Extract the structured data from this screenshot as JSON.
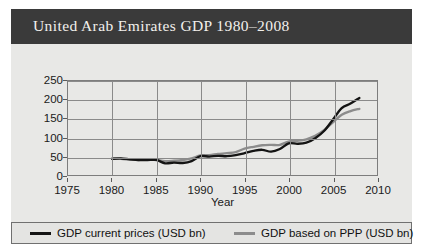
{
  "title": "United Arab Emirates GDP 1980–2008",
  "colors": {
    "title_bar_bg": "#3a3a3a",
    "title_text": "#f2f0ec",
    "panel_bg": "#e8e8e6",
    "grid": "#8a8a8a",
    "frame": "#7d7d7d",
    "series_current_prices": "#141414",
    "series_ppp": "#8c8c8c",
    "legend_bg": "#e4e4e2",
    "legend_border": "#707070"
  },
  "legend": {
    "position": "below-plot",
    "entries": [
      {
        "label": "GDP current prices (USD bn)",
        "color": "#141414",
        "icon": "line-swatch"
      },
      {
        "label": "GDP based on PPP (USD bn)",
        "color": "#8c8c8c",
        "icon": "line-swatch"
      }
    ]
  },
  "chart_data": {
    "type": "line",
    "title": "United Arab Emirates GDP 1980–2008",
    "xlabel": "Year",
    "ylabel": "",
    "xlim": [
      1975,
      2010
    ],
    "ylim": [
      0,
      250
    ],
    "xticks": [
      1975,
      1980,
      1985,
      1990,
      1995,
      2000,
      2005,
      2010
    ],
    "yticks": [
      0,
      50,
      100,
      150,
      200,
      250
    ],
    "grid": true,
    "x": [
      1980,
      1981,
      1982,
      1983,
      1984,
      1985,
      1986,
      1987,
      1988,
      1989,
      1990,
      1991,
      1992,
      1993,
      1994,
      1995,
      1996,
      1997,
      1998,
      1999,
      2000,
      2001,
      2002,
      2003,
      2004,
      2005,
      2006,
      2007,
      2008
    ],
    "series": [
      {
        "name": "GDP current prices (USD bn)",
        "color": "#141414",
        "values": [
          43,
          44,
          42,
          40,
          40,
          40,
          31,
          33,
          32,
          37,
          50,
          49,
          51,
          50,
          53,
          58,
          64,
          67,
          62,
          69,
          84,
          83,
          86,
          98,
          117,
          147,
          178,
          190,
          205
        ]
      },
      {
        "name": "GDP based on PPP (USD bn)",
        "color": "#8c8c8c",
        "values": [
          44,
          43,
          41,
          40,
          42,
          40,
          37,
          38,
          40,
          44,
          52,
          53,
          56,
          58,
          61,
          70,
          75,
          79,
          80,
          80,
          89,
          91,
          95,
          104,
          119,
          140,
          160,
          170,
          176
        ]
      }
    ]
  }
}
